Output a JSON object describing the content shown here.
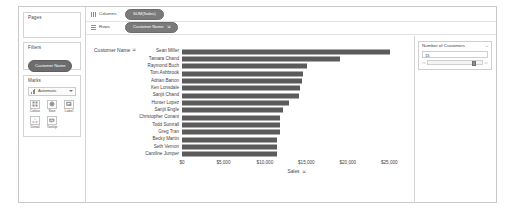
{
  "window": {
    "title": "Tableau Worksheet"
  },
  "left_panel": {
    "pages": {
      "title": "Pages"
    },
    "filters": {
      "title": "Filters",
      "pills": [
        {
          "label": "Customer Name"
        }
      ]
    },
    "marks": {
      "title": "Marks",
      "mark_type": "Automatic",
      "mark_type_icon": "bar-chart-icon",
      "dropdown_icon": "chevron-down-icon",
      "buttons": [
        {
          "label": "Colour",
          "icon": "colour-icon"
        },
        {
          "label": "Size",
          "icon": "size-icon"
        },
        {
          "label": "Label",
          "icon": "label-icon"
        },
        {
          "label": "Detail",
          "icon": "detail-icon"
        },
        {
          "label": "Tooltip",
          "icon": "tooltip-icon"
        }
      ]
    }
  },
  "shelves": [
    {
      "name": "Columns",
      "icon": "columns-icon",
      "pill": {
        "label": "SUM(Sales)",
        "sort_indicator": ""
      }
    },
    {
      "name": "Rows",
      "icon": "rows-icon",
      "pill": {
        "label": "Customer Name",
        "sort_indicator": "⇲"
      }
    }
  ],
  "view": {
    "row_field_caption": "Customer Name",
    "row_field_sort_icon": "sort-descending-icon",
    "axis_title": "Sales",
    "axis_title_sort_icon": "sort-descending-icon"
  },
  "right_panel": {
    "parameter": {
      "title": "Number of Customers",
      "menu_icon": "chevron-down-icon",
      "value": "15",
      "slider": {
        "decrement_icon": "slider-left-arrow-icon",
        "increment_icon": "slider-right-arrow-icon",
        "position_percent": 88
      }
    }
  },
  "colors": {
    "bar": "#5b5b5b",
    "pill": "#7a7a7a",
    "filter_pill": "#6d6d6d",
    "text": "#3f3f3f",
    "border": "#d4d4d4"
  },
  "chart_data": {
    "type": "bar",
    "title": "",
    "orientation": "horizontal",
    "xlabel": "Sales",
    "ylabel": "Customer Name",
    "xlim": [
      0,
      27500
    ],
    "grid": false,
    "legend": "none",
    "tick_labels": [
      "$0",
      "$5,000",
      "$10,000",
      "$15,000",
      "$20,000",
      "$25,000"
    ],
    "tick_values": [
      0,
      5000,
      10000,
      15000,
      20000,
      25000
    ],
    "categories": [
      "Sean Miller",
      "Tamara Chand",
      "Raymond Buch",
      "Tom Ashbrook",
      "Adrian Barton",
      "Ken Lonsdale",
      "Sanjit Chand",
      "Hunter Lopez",
      "Sanjit Engle",
      "Christopher Conant",
      "Todd Sumrall",
      "Greg Tran",
      "Becky Martin",
      "Seth Vernon",
      "Caroline Jumper"
    ],
    "values": [
      25043,
      19052,
      15117,
      14596,
      14474,
      14175,
      14142,
      12873,
      12210,
      11821,
      11812,
      11771,
      11479,
      11470,
      11441
    ]
  }
}
